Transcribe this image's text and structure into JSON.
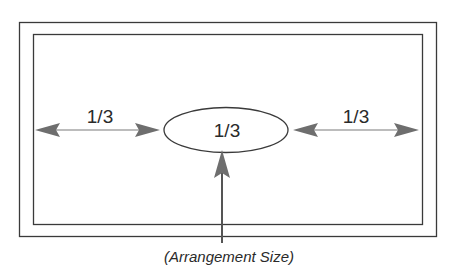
{
  "diagram": {
    "title": "",
    "left_label": "1/3",
    "center_label": "1/3",
    "right_label": "1/3",
    "caption": "(Arrangement Size)",
    "colors": {
      "line": "#3a3a3a",
      "arrow": "#6e6e6e",
      "background": "#ffffff"
    }
  }
}
